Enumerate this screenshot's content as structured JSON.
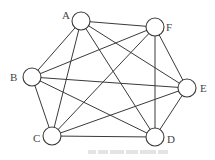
{
  "graph": {
    "type": "complete-graph-K6",
    "nodes": [
      {
        "id": "A",
        "label": "A",
        "x": 81,
        "y": 21,
        "lx": 62,
        "ly": 19
      },
      {
        "id": "F",
        "label": "F",
        "x": 155,
        "y": 27,
        "lx": 166,
        "ly": 31
      },
      {
        "id": "B",
        "label": "B",
        "x": 32,
        "y": 77,
        "lx": 10,
        "ly": 81
      },
      {
        "id": "E",
        "label": "E",
        "x": 187,
        "y": 88,
        "lx": 200,
        "ly": 92
      },
      {
        "id": "C",
        "label": "C",
        "x": 52,
        "y": 136,
        "lx": 33,
        "ly": 142
      },
      {
        "id": "D",
        "label": "D",
        "x": 155,
        "y": 137,
        "lx": 167,
        "ly": 143
      }
    ],
    "edges": [
      [
        "A",
        "F"
      ],
      [
        "A",
        "B"
      ],
      [
        "A",
        "C"
      ],
      [
        "A",
        "D"
      ],
      [
        "A",
        "E"
      ],
      [
        "F",
        "B"
      ],
      [
        "F",
        "C"
      ],
      [
        "F",
        "D"
      ],
      [
        "F",
        "E"
      ],
      [
        "B",
        "E"
      ],
      [
        "B",
        "D"
      ],
      [
        "B",
        "C"
      ],
      [
        "C",
        "E"
      ],
      [
        "C",
        "D"
      ],
      [
        "D",
        "E"
      ]
    ],
    "node_radius": 9,
    "stroke_color": "#3a3a3a"
  }
}
